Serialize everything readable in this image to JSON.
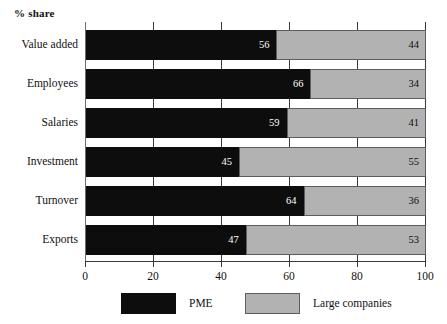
{
  "chart_data": {
    "type": "bar",
    "orientation": "horizontal",
    "stacked": true,
    "stacked_percent": true,
    "title": "",
    "xlabel": "",
    "ylabel": "",
    "axis_title": "% share",
    "grid": true,
    "legend_position": "bottom",
    "xlim": [
      0,
      100
    ],
    "xticks": [
      0,
      20,
      40,
      60,
      80,
      100
    ],
    "xtick_labels": [
      "0",
      "20",
      "40",
      "60",
      "80",
      "100"
    ],
    "categories": [
      "Value added",
      "Employees",
      "Salaries",
      "Investment",
      "Turnover",
      "Exports"
    ],
    "series": [
      {
        "name": "PME",
        "color": "#0d0d0d",
        "values": [
          56,
          66,
          59,
          45,
          64,
          47
        ]
      },
      {
        "name": "Large companies",
        "color": "#b2b2b2",
        "values": [
          44,
          34,
          41,
          55,
          36,
          53
        ]
      }
    ],
    "data_labels": [
      {
        "category": "Value added",
        "pme": "56",
        "large": "44"
      },
      {
        "category": "Employees",
        "pme": "66",
        "large": "34"
      },
      {
        "category": "Salaries",
        "pme": "59",
        "large": "41"
      },
      {
        "category": "Investment",
        "pme": "45",
        "large": "55"
      },
      {
        "category": "Turnover",
        "pme": "64",
        "large": "36"
      },
      {
        "category": "Exports",
        "pme": "47",
        "large": "53"
      }
    ]
  },
  "legend": {
    "items": [
      {
        "label": "PME",
        "color": "#0d0d0d"
      },
      {
        "label": "Large companies",
        "color": "#b2b2b2"
      }
    ]
  }
}
